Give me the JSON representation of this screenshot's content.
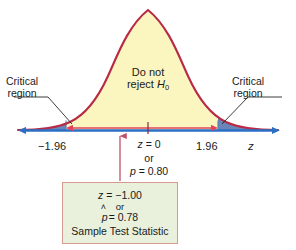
{
  "figure": {
    "type": "normal-distribution-hypothesis-test",
    "curve": {
      "fill_color": "#fbf5c0",
      "stroke_color": "#b82a46",
      "peak_x_z": 0
    },
    "axis": {
      "label": "z",
      "line_color": "#2a6fc4",
      "tick_values": [
        "−1.96",
        "1.96"
      ],
      "center_tick": true
    },
    "critical_regions": {
      "label_left": "Critical\nregion",
      "label_left_line1": "Critical",
      "label_left_line2": "region",
      "label_right_line1": "Critical",
      "label_right_line2": "region",
      "shade_color": "#6a86b8",
      "bounds": [
        "−1.96",
        "1.96"
      ]
    },
    "acceptance_region": {
      "line1": "Do not",
      "line2_prefix": "reject ",
      "line2_symbol": "H",
      "line2_subscript": "0",
      "span_arrow_color": "#e2445c"
    },
    "center_labels": {
      "z_label": "z",
      "z_eq": " = 0",
      "or": "or",
      "p_label": "p",
      "p_eq": " = 0.80"
    },
    "callout": {
      "border_color": "#d79a8e",
      "fill_color": "#e9f0dc",
      "pointer_color": "#c0506a",
      "z_label": "z",
      "z_value": " = −1.00",
      "or": "or",
      "phat_symbol": "p",
      "phat_hat": "˄",
      "phat_value": " = 0.78",
      "caption": "Sample Test Statistic"
    }
  }
}
